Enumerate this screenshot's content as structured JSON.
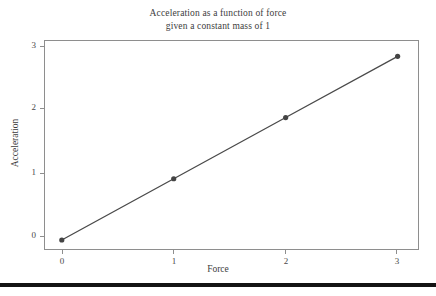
{
  "chart_data": {
    "type": "line",
    "title": "Acceleration as a function of force given a constant mass of 1",
    "title_lines": [
      "Acceleration as a function of force",
      "given a constant mass of 1"
    ],
    "xlabel": "Force",
    "ylabel": "Acceleration",
    "x": [
      0,
      1,
      2,
      3
    ],
    "values": [
      0,
      1,
      2,
      3
    ],
    "series": [
      {
        "name": "Acceleration",
        "values": [
          0,
          1,
          2,
          3
        ],
        "color": "#4a4a4a",
        "marker": "circle",
        "marker_color": "#444444"
      }
    ],
    "xlim": [
      -0.15,
      3.2
    ],
    "ylim": [
      -0.18,
      3.25
    ],
    "xticks": [
      0,
      1,
      2,
      3
    ],
    "xtick_labels": [
      "0",
      "1",
      "2",
      "3"
    ],
    "yticks": [
      0,
      1,
      2,
      3
    ],
    "ytick_labels": [
      "0",
      "1",
      "2",
      "3"
    ],
    "grid": false,
    "legend": null,
    "legend_position": "none",
    "background_color": "#ffffff",
    "frame_color": "#8e8e8e",
    "text_color": "#3d3d3d"
  },
  "figure": {
    "bottom_rule_color": "#141414"
  }
}
